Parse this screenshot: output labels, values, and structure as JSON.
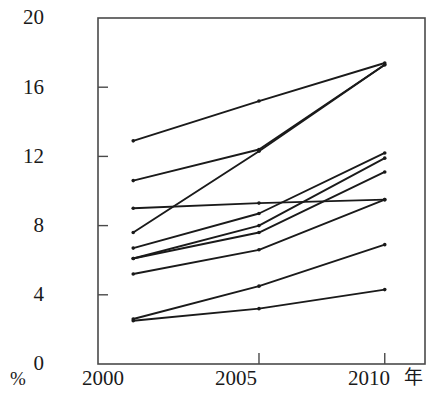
{
  "chart_data": {
    "type": "line",
    "title": "",
    "xlabel": "年",
    "ylabel": "%",
    "x": [
      2000,
      2005,
      2010
    ],
    "xlim": [
      1998.6,
      2011.6
    ],
    "ylim": [
      0,
      20
    ],
    "yticks": [
      0,
      4,
      8,
      12,
      16,
      20
    ],
    "xticks": [
      2000,
      2005,
      2010
    ],
    "grid": false,
    "legend": false,
    "frame": "box",
    "markers": "dot",
    "line_color": "#1a1a1a",
    "series": [
      {
        "name": "series-1",
        "values": [
          12.9,
          15.2,
          17.4
        ]
      },
      {
        "name": "series-2",
        "values": [
          10.6,
          12.4,
          17.3
        ]
      },
      {
        "name": "series-3",
        "values": [
          9.0,
          9.3,
          9.5
        ]
      },
      {
        "name": "series-4",
        "values": [
          7.6,
          12.3,
          17.3
        ]
      },
      {
        "name": "series-5",
        "values": [
          6.7,
          8.7,
          12.2
        ]
      },
      {
        "name": "series-6",
        "values": [
          6.1,
          8.0,
          11.9
        ]
      },
      {
        "name": "series-7",
        "values": [
          6.1,
          7.6,
          11.1
        ]
      },
      {
        "name": "series-8",
        "values": [
          5.2,
          6.6,
          9.5
        ]
      },
      {
        "name": "series-9",
        "values": [
          2.6,
          4.5,
          6.9
        ]
      },
      {
        "name": "series-10",
        "values": [
          2.5,
          3.2,
          4.3
        ]
      }
    ]
  },
  "axes": {
    "y_tick_labels": [
      "20",
      "16",
      "12",
      "8",
      "4",
      "0"
    ],
    "x_tick_labels": [
      "2000",
      "2005",
      "2010"
    ],
    "y_unit_label": "%",
    "x_unit_label": "年"
  }
}
